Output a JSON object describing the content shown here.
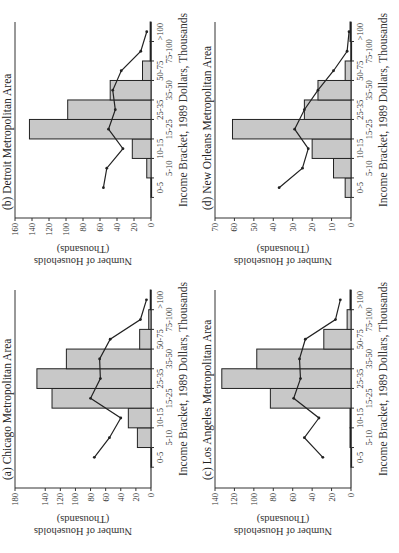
{
  "chart_data": [
    {
      "type": "bar",
      "panel": "a",
      "title": "(a) Chicago Metropolitan Area",
      "xlabel": "Income Bracket, 1989 Dollars, Thousands",
      "ylabel": "Number of Households",
      "ylabel2": "(Thousands)",
      "categories": [
        "0-5",
        "5-10",
        "10-15",
        "15-25",
        "25-35",
        "35-50",
        "50-75",
        "75-100",
        ">100"
      ],
      "ylim": [
        0,
        180
      ],
      "yticks": [
        0,
        20,
        40,
        60,
        80,
        100,
        120,
        140,
        180
      ],
      "series": [
        {
          "name": "bars",
          "type": "bar",
          "values": [
            0,
            18,
            30,
            131,
            151,
            112,
            15,
            3,
            1
          ]
        },
        {
          "name": "line",
          "type": "line",
          "values": [
            75,
            55,
            40,
            80,
            67,
            68,
            54,
            14,
            6
          ]
        }
      ]
    },
    {
      "type": "bar",
      "panel": "b",
      "title": "(b) Detroit Metropolitan Area",
      "xlabel": "Income Bracket, 1989 Dollars, Thousands",
      "ylabel": "Number of Households",
      "ylabel2": "(Thousands)",
      "categories": [
        "0-5",
        "5-10",
        "10-15",
        "15-25",
        "25-35",
        "35-50",
        "50-75",
        "75-100",
        ">100"
      ],
      "ylim": [
        0,
        160
      ],
      "yticks": [
        0,
        20,
        40,
        60,
        80,
        100,
        120,
        140,
        160
      ],
      "series": [
        {
          "name": "bars",
          "type": "bar",
          "values": [
            0,
            5,
            22,
            143,
            98,
            48,
            10,
            1,
            1
          ]
        },
        {
          "name": "line",
          "type": "line",
          "values": [
            56,
            52,
            33,
            50,
            42,
            45,
            35,
            12,
            5
          ]
        }
      ]
    },
    {
      "type": "bar",
      "panel": "c",
      "title": "(c) Los Angeles Metropolitan Area",
      "xlabel": "Income Bracket, 1989 Dollars, Thousands",
      "ylabel": "Number of Households",
      "ylabel2": "(Thousands)",
      "categories": [
        "0-5",
        "5-10",
        "10-15",
        "15-25",
        "25-35",
        "35-50",
        "50-75",
        "75-100",
        ">100"
      ],
      "ylim": [
        0,
        140
      ],
      "yticks": [
        0,
        20,
        40,
        60,
        80,
        100,
        120,
        140
      ],
      "series": [
        {
          "name": "bars",
          "type": "bar",
          "values": [
            0,
            1,
            1,
            83,
            133,
            97,
            28,
            4,
            1
          ]
        },
        {
          "name": "line",
          "type": "line",
          "values": [
            29,
            48,
            33,
            59,
            52,
            53,
            47,
            16,
            11
          ]
        }
      ]
    },
    {
      "type": "bar",
      "panel": "d",
      "title": "(d) New Orleans Metropolitan Area",
      "xlabel": "Income Bracket, 1989 Dollars, Thousands",
      "ylabel": "Number of Households",
      "ylabel2": "(Thousands)",
      "categories": [
        "0-5",
        "5-10",
        "10-15",
        "15-25",
        "25-35",
        "35-50",
        "50-75",
        "75-100",
        ">100"
      ],
      "ylim": [
        0,
        70
      ],
      "yticks": [
        0,
        10,
        20,
        30,
        40,
        50,
        60,
        70
      ],
      "series": [
        {
          "name": "bars",
          "type": "bar",
          "values": [
            3,
            9,
            20,
            61,
            24,
            17,
            3,
            0,
            0.5
          ]
        },
        {
          "name": "line",
          "type": "line",
          "values": [
            37,
            25,
            22,
            29,
            24,
            17,
            9,
            2,
            1
          ]
        }
      ]
    }
  ],
  "colors": {
    "bar_fill": "#c8c8c8",
    "bar_stroke": "#222222",
    "line": "#222222",
    "axis": "#333333"
  }
}
